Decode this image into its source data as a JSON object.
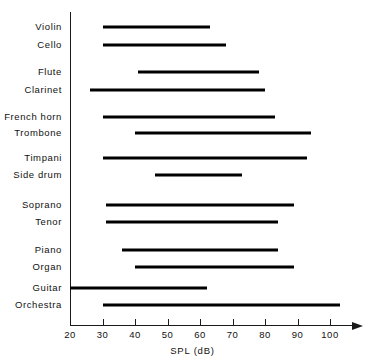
{
  "chart_data": {
    "type": "bar",
    "orientation": "horizontal-range",
    "title": "",
    "xlabel": "SPL  (dB)",
    "ylabel": "",
    "xlim": [
      20,
      105
    ],
    "xticks": [
      20,
      30,
      40,
      50,
      60,
      70,
      80,
      90,
      100
    ],
    "xtick_labels": [
      "20",
      "30",
      "40",
      "50",
      "60",
      "70",
      "80",
      "90",
      "100"
    ],
    "grid": false,
    "legend": null,
    "categories": [
      "Violin",
      "Cello",
      "Flute",
      "Clarinet",
      "French  horn",
      "Trombone",
      "Timpani",
      "Side  drum",
      "Soprano",
      "Tenor",
      "Piano",
      "Organ",
      "Guitar",
      "Orchestra"
    ],
    "ranges": [
      {
        "label": "Violin",
        "low": 30,
        "high": 63
      },
      {
        "label": "Cello",
        "low": 30,
        "high": 68
      },
      {
        "label": "Flute",
        "low": 41,
        "high": 78
      },
      {
        "label": "Clarinet",
        "low": 26,
        "high": 80
      },
      {
        "label": "French  horn",
        "low": 30,
        "high": 83
      },
      {
        "label": "Trombone",
        "low": 40,
        "high": 94
      },
      {
        "label": "Timpani",
        "low": 30,
        "high": 93
      },
      {
        "label": "Side  drum",
        "low": 46,
        "high": 73
      },
      {
        "label": "Soprano",
        "low": 31,
        "high": 89
      },
      {
        "label": "Tenor",
        "low": 31,
        "high": 84
      },
      {
        "label": "Piano",
        "low": 36,
        "high": 84
      },
      {
        "label": "Organ",
        "low": 40,
        "high": 89
      },
      {
        "label": "Guitar",
        "low": 20,
        "high": 62
      },
      {
        "label": "Orchestra",
        "low": 30,
        "high": 103
      }
    ],
    "row_y": [
      27,
      45,
      72,
      90,
      117,
      133,
      158,
      175,
      205,
      222,
      250,
      267,
      288,
      305
    ],
    "colors": {
      "bar": "#000000",
      "axis": "#1a1a1a",
      "text": "#111111",
      "background": "#ffffff"
    }
  }
}
